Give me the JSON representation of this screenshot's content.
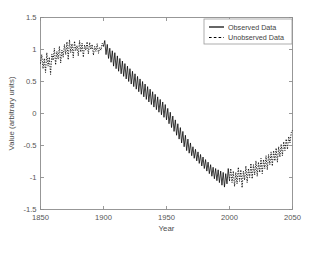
{
  "chart_data": {
    "type": "line",
    "title": "",
    "xlabel": "Year",
    "ylabel": "Value (arbitrary units)",
    "xlim": [
      1850,
      2050
    ],
    "ylim": [
      -1.5,
      1.5
    ],
    "xticks": [
      1850,
      1900,
      1950,
      2000,
      2050
    ],
    "xtick_labels": [
      "1850",
      "1900",
      "1950",
      "2000",
      "2050"
    ],
    "yticks": [
      -1.5,
      -1,
      -0.5,
      0,
      0.5,
      1,
      1.5
    ],
    "ytick_labels": [
      "-1.5",
      "-1",
      "-0.5",
      "0",
      "0.5",
      "1",
      "1.5"
    ],
    "grid": false,
    "legend_position": "top-right",
    "legend": [
      "Observed Data",
      "Unobserved Data"
    ],
    "series": [
      {
        "name": "Unobserved Data",
        "style": "dashed",
        "color": "#000000",
        "x": [
          1850,
          1851,
          1852,
          1853,
          1854,
          1855,
          1856,
          1857,
          1858,
          1859,
          1860,
          1861,
          1862,
          1863,
          1864,
          1865,
          1866,
          1867,
          1868,
          1869,
          1870,
          1871,
          1872,
          1873,
          1874,
          1875,
          1876,
          1877,
          1878,
          1879,
          1880,
          1881,
          1882,
          1883,
          1884,
          1885,
          1886,
          1887,
          1888,
          1889,
          1890,
          1891,
          1892,
          1893,
          1894,
          1895,
          1896,
          1897,
          1898,
          1899,
          1900
        ],
        "y": [
          0.78,
          0.92,
          0.7,
          0.86,
          0.64,
          0.95,
          0.74,
          0.88,
          0.61,
          0.93,
          0.83,
          1.02,
          0.76,
          0.97,
          0.85,
          1.05,
          0.79,
          0.99,
          0.88,
          1.08,
          0.92,
          1.12,
          0.84,
          1.15,
          0.95,
          1.09,
          0.87,
          1.13,
          0.98,
          1.06,
          0.9,
          1.14,
          0.96,
          1.1,
          0.88,
          1.07,
          0.99,
          1.12,
          0.93,
          1.11,
          1.0,
          1.08,
          0.91,
          1.05,
          0.97,
          1.09,
          0.94,
          1.03,
          0.99,
          1.1,
          1.05
        ]
      },
      {
        "name": "Observed Data",
        "style": "solid",
        "color": "#000000",
        "x": [
          1900,
          1901,
          1902,
          1903,
          1904,
          1905,
          1906,
          1907,
          1908,
          1909,
          1910,
          1911,
          1912,
          1913,
          1914,
          1915,
          1916,
          1917,
          1918,
          1919,
          1920,
          1921,
          1922,
          1923,
          1924,
          1925,
          1926,
          1927,
          1928,
          1929,
          1930,
          1931,
          1932,
          1933,
          1934,
          1935,
          1936,
          1937,
          1938,
          1939,
          1940,
          1941,
          1942,
          1943,
          1944,
          1945,
          1946,
          1947,
          1948,
          1949,
          1950,
          1951,
          1952,
          1953,
          1954,
          1955,
          1956,
          1957,
          1958,
          1959,
          1960,
          1961,
          1962,
          1963,
          1964,
          1965,
          1966,
          1967,
          1968,
          1969,
          1970,
          1971,
          1972,
          1973,
          1974,
          1975,
          1976,
          1977,
          1978,
          1979,
          1980,
          1981,
          1982,
          1983,
          1984,
          1985,
          1986,
          1987,
          1988,
          1989,
          1990,
          1991,
          1992,
          1993,
          1994,
          1995,
          1996,
          1997,
          1998,
          1999,
          2000
        ],
        "y": [
          1.05,
          1.14,
          0.92,
          1.08,
          0.86,
          1.02,
          0.8,
          0.98,
          0.74,
          0.95,
          0.7,
          0.9,
          0.66,
          0.86,
          0.62,
          0.82,
          0.58,
          0.78,
          0.54,
          0.74,
          0.5,
          0.7,
          0.46,
          0.66,
          0.42,
          0.62,
          0.38,
          0.58,
          0.34,
          0.54,
          0.3,
          0.5,
          0.26,
          0.46,
          0.22,
          0.42,
          0.18,
          0.38,
          0.14,
          0.34,
          0.1,
          0.3,
          0.06,
          0.26,
          0.02,
          0.22,
          -0.02,
          0.18,
          -0.06,
          0.14,
          -0.1,
          0.08,
          -0.16,
          0.02,
          -0.22,
          -0.04,
          -0.28,
          -0.1,
          -0.34,
          -0.16,
          -0.4,
          -0.22,
          -0.46,
          -0.28,
          -0.52,
          -0.34,
          -0.58,
          -0.4,
          -0.62,
          -0.46,
          -0.66,
          -0.52,
          -0.7,
          -0.56,
          -0.74,
          -0.6,
          -0.78,
          -0.64,
          -0.82,
          -0.68,
          -0.86,
          -0.72,
          -0.9,
          -0.76,
          -0.94,
          -0.8,
          -0.98,
          -0.84,
          -1.02,
          -0.86,
          -1.05,
          -0.88,
          -1.08,
          -0.9,
          -1.12,
          -0.92,
          -1.15,
          -0.94,
          -1.1,
          -0.86,
          -1.05
        ]
      },
      {
        "name": "Unobserved Data Future",
        "style": "dashed",
        "color": "#000000",
        "x": [
          2000,
          2001,
          2002,
          2003,
          2004,
          2005,
          2006,
          2007,
          2008,
          2009,
          2010,
          2011,
          2012,
          2013,
          2014,
          2015,
          2016,
          2017,
          2018,
          2019,
          2020,
          2021,
          2022,
          2023,
          2024,
          2025,
          2026,
          2027,
          2028,
          2029,
          2030,
          2031,
          2032,
          2033,
          2034,
          2035,
          2036,
          2037,
          2038,
          2039,
          2040,
          2041,
          2042,
          2043,
          2044,
          2045,
          2046,
          2047,
          2048,
          2049,
          2050
        ],
        "y": [
          -1.05,
          -0.86,
          -1.08,
          -0.9,
          -1.14,
          -0.92,
          -1.1,
          -0.84,
          -1.06,
          -0.88,
          -1.16,
          -0.9,
          -1.04,
          -0.82,
          -1.08,
          -0.86,
          -1.0,
          -0.78,
          -1.02,
          -0.8,
          -0.96,
          -0.74,
          -0.98,
          -0.76,
          -0.92,
          -0.7,
          -0.94,
          -0.72,
          -0.86,
          -0.66,
          -0.88,
          -0.64,
          -0.8,
          -0.6,
          -0.82,
          -0.58,
          -0.74,
          -0.54,
          -0.76,
          -0.52,
          -0.68,
          -0.48,
          -0.66,
          -0.44,
          -0.58,
          -0.4,
          -0.56,
          -0.36,
          -0.46,
          -0.3,
          -0.26
        ]
      }
    ]
  },
  "legend": {
    "items": [
      {
        "label": "Observed Data",
        "style": "solid"
      },
      {
        "label": "Unobserved Data",
        "style": "dashed"
      }
    ]
  }
}
